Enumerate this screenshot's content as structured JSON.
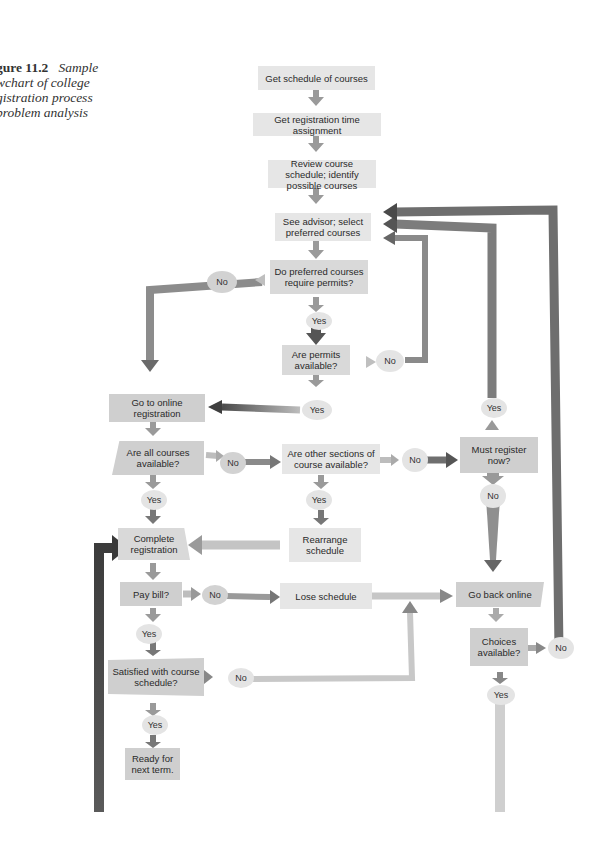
{
  "caption": {
    "figure_label": "gure 11.2",
    "lines": [
      "Sample",
      "wchart of college",
      "gistration process",
      "problem analysis"
    ]
  },
  "nodes": {
    "get_schedule": "Get schedule of courses",
    "get_time": "Get registration time assignment",
    "review": "Review course schedule; identify possible courses",
    "see_advisor": "See advisor; select preferred courses",
    "require_permits": "Do preferred courses require permits?",
    "permits_available": "Are permits available?",
    "go_online": "Go to online registration",
    "all_available": "Are all courses available?",
    "other_sections": "Are other sections of course available?",
    "must_register": "Must register now?",
    "complete": "Complete registration",
    "rearrange": "Rearrange schedule",
    "pay_bill": "Pay bill?",
    "lose_schedule": "Lose schedule",
    "go_back": "Go back online",
    "satisfied": "Satisfied with course schedule?",
    "choices": "Choices available?",
    "ready": "Ready for next term."
  },
  "labels": {
    "yes": "Yes",
    "no": "No"
  },
  "colors": {
    "box": "#d9d9d9",
    "arrow_dark": "#5a5a5a",
    "arrow_mid": "#8a8a8a",
    "arrow_light": "#c4c4c4"
  }
}
